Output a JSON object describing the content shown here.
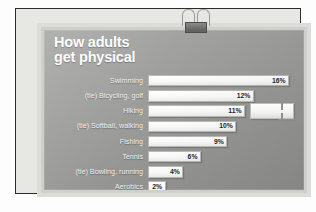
{
  "board": {
    "title": "How adults\nget physical",
    "title_color": "#ffffff",
    "board_color": "#9e9e9c",
    "bar_color": "#ffffff",
    "frame_color": "#2b2b2b"
  },
  "decorations": {
    "binder_clip": "binder-clip",
    "edge_clamp": "edge-clamp"
  },
  "chart_data": {
    "type": "bar",
    "orientation": "horizontal",
    "title": "How adults get physical",
    "xlabel": "",
    "ylabel": "",
    "xlim": [
      0,
      17
    ],
    "grid": false,
    "legend": null,
    "unit": "%",
    "categories": [
      "Swimming",
      "(tie) Bicycling, golf",
      "Hiking",
      "(tie) Softball, walking",
      "Fishing",
      "Tennis",
      "(tie) Bowling, running",
      "Aerobics"
    ],
    "values": [
      16,
      12,
      11,
      10,
      9,
      6,
      4,
      2
    ],
    "value_labels": [
      "16%",
      "12%",
      "11%",
      "10%",
      "9%",
      "6%",
      "4%",
      "2%"
    ]
  }
}
